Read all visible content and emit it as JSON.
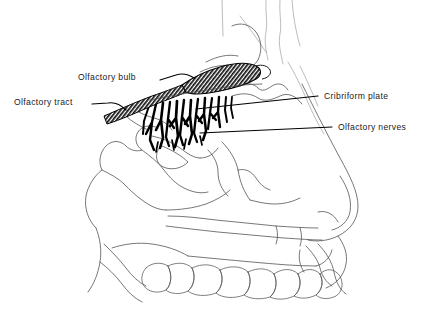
{
  "figure": {
    "background_color": "#ffffff",
    "ink_color": "#000000",
    "outline_color": "#4a4a4a",
    "width": 424,
    "height": 331
  },
  "labels": [
    {
      "id": "olfactory-bulb",
      "text": "Olfactory bulb",
      "text_x": 78,
      "text_y": 78,
      "anchor": "start",
      "leader": "M 160 80 L 176 75 C 182 73 188 74 194 78",
      "side": "left"
    },
    {
      "id": "olfactory-tract",
      "text": "Olfactory tract",
      "text_x": 14,
      "text_y": 103,
      "anchor": "start",
      "leader": "M 92 104 L 108 103 C 114 102 120 104 126 110",
      "side": "left"
    },
    {
      "id": "cribriform-plate",
      "text": "Cribriform plate",
      "text_x": 324,
      "text_y": 97,
      "anchor": "start",
      "leader": "M 196 109 L 318 96",
      "side": "right"
    },
    {
      "id": "olfactory-nerves",
      "text": "Olfactory nerves",
      "text_x": 338,
      "text_y": 128,
      "anchor": "start",
      "leader": "M 200 133 L 332 127",
      "side": "right"
    }
  ],
  "structures": {
    "olfactory_bulb": {
      "name": "olfactory-bulb-shape",
      "fill_pattern": "cross-hatch-dark",
      "description": "Elongated shaded oval tapering to the left"
    },
    "olfactory_tract": {
      "name": "olfactory-tract-shape",
      "fill_pattern": "cross-hatch-dark",
      "description": "Narrow shaded band running down-left from the bulb"
    },
    "olfactory_nerves": {
      "name": "olfactory-nerve-bundle",
      "fill_pattern": "solid-black",
      "fiber_count": 13,
      "description": "Dense tuft of branching black filaments descending below the cribriform plate"
    },
    "cribriform_plate": {
      "name": "cribriform-plate-line",
      "description": "Horizontal bony shelf beneath the olfactory bulb"
    }
  },
  "skull_regions": [
    {
      "id": "frontal-sinus",
      "label": "frontal sinus"
    },
    {
      "id": "nasal-bone",
      "label": "nasal bone"
    },
    {
      "id": "sphenoid-sinus",
      "label": "sphenoid sinus"
    },
    {
      "id": "sella-turcica",
      "label": "sella turcica"
    },
    {
      "id": "nasal-turbinates",
      "label": "nasal turbinates"
    },
    {
      "id": "hard-palate",
      "label": "hard palate"
    },
    {
      "id": "maxillary-teeth",
      "label": "maxillary teeth"
    },
    {
      "id": "nose-profile",
      "label": "external nose profile"
    }
  ],
  "teeth": {
    "count": 8,
    "row_label": "upper dental arch"
  }
}
